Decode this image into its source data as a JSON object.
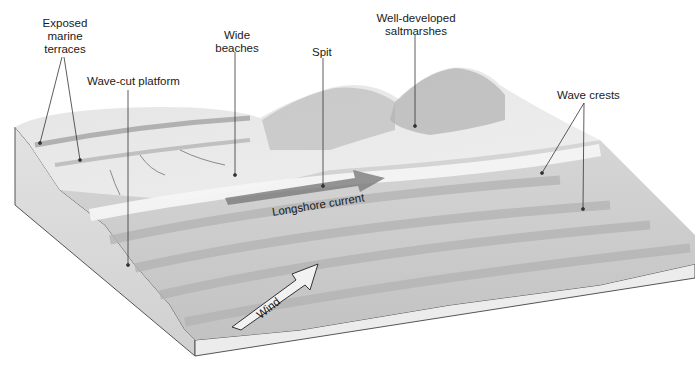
{
  "diagram": {
    "labels": {
      "exposed_marine_terraces": "Exposed\nmarine\nterraces",
      "exposed_marine_terraces_lines": [
        "Exposed",
        "marine",
        "terraces"
      ],
      "wave_cut_platform": "Wave-cut platform",
      "wide_beaches_lines": [
        "Wide",
        "beaches"
      ],
      "spit": "Spit",
      "saltmarshes_lines": [
        "Well-developed",
        "saltmarshes"
      ],
      "wave_crests": "Wave crests",
      "longshore_current": "Longshore current",
      "wind": "Wind"
    },
    "colors": {
      "background": "#ffffff",
      "surface_light": "#e8e8e8",
      "surface_mid": "#c9c9c9",
      "surface_dark": "#a8a8a8",
      "side_face": "#dcdcdc",
      "outline": "#555555",
      "current_arrow": "#7a7a7a",
      "text": "#1a1a1a"
    }
  }
}
